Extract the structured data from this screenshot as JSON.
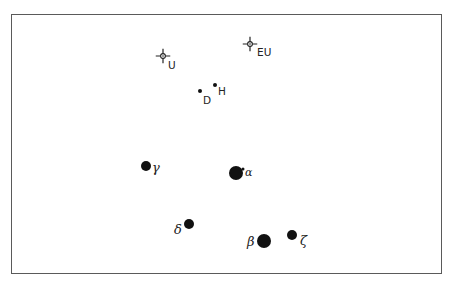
{
  "diagram": {
    "type": "star-chart",
    "frame_color": "#5a5a5a",
    "star_color": "#111111",
    "stars": [
      {
        "id": "gamma",
        "label": "γ",
        "x": 146,
        "y": 166,
        "r": 5
      },
      {
        "id": "alpha",
        "label": "α",
        "x": 236,
        "y": 173,
        "r": 7
      },
      {
        "id": "delta",
        "label": "δ",
        "x": 189,
        "y": 224,
        "r": 5
      },
      {
        "id": "beta",
        "label": "β",
        "x": 264,
        "y": 241,
        "r": 7
      },
      {
        "id": "zeta",
        "label": "ζ",
        "x": 292,
        "y": 235,
        "r": 5
      }
    ],
    "alpha_companion": {
      "x": 243,
      "y": 169,
      "r": 1.6
    },
    "small_objects": [
      {
        "id": "D",
        "label": "D",
        "x": 200,
        "y": 91
      },
      {
        "id": "H",
        "label": "H",
        "x": 215,
        "y": 85
      }
    ],
    "markers": [
      {
        "id": "U",
        "label": "U",
        "x": 163,
        "y": 56
      },
      {
        "id": "EU",
        "label": "EU",
        "x": 250,
        "y": 44
      }
    ]
  }
}
